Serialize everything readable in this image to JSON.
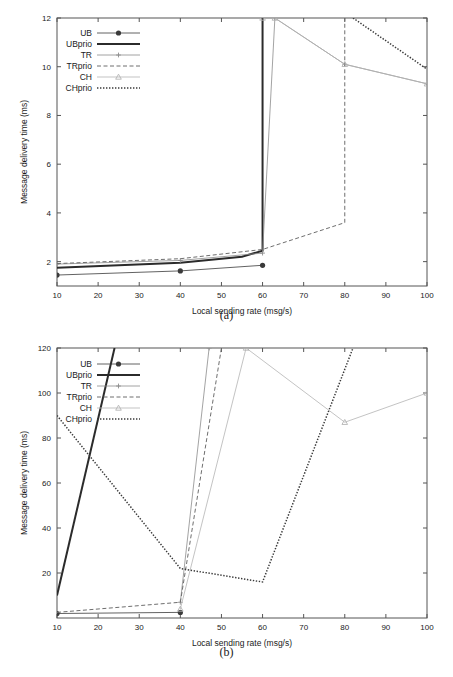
{
  "figure": {
    "caption_a": "(a)",
    "caption_b": "(b)"
  },
  "chart_data": [
    {
      "type": "line",
      "panel": "(a)",
      "title": "",
      "xlabel": "Local sending rate (msg/s)",
      "ylabel": "Message delivery time (ms)",
      "xlim": [
        10,
        100
      ],
      "ylim": [
        1,
        12
      ],
      "xticks": [
        10,
        20,
        30,
        40,
        50,
        60,
        70,
        80,
        90,
        100
      ],
      "yticks": [
        2,
        4,
        6,
        8,
        10,
        12
      ],
      "grid": false,
      "legend_position": "top-left",
      "series": [
        {
          "name": "UB",
          "style": "solid-thin-marker",
          "marker": "dot",
          "color": "#3a3a3a",
          "x": [
            10,
            40,
            60
          ],
          "y": [
            1.45,
            1.62,
            1.85
          ]
        },
        {
          "name": "UBprio",
          "style": "solid-thick",
          "marker": "none",
          "color": "#2b2b2b",
          "x": [
            10,
            40,
            55,
            60,
            60
          ],
          "y": [
            1.75,
            1.95,
            2.2,
            2.45,
            12.0
          ]
        },
        {
          "name": "TR",
          "style": "solid-thin-marker",
          "marker": "cross",
          "color": "#8c8c8c",
          "x": [
            10,
            40,
            60,
            63,
            80,
            100
          ],
          "y": [
            1.9,
            2.05,
            2.35,
            12.0,
            10.1,
            9.3
          ]
        },
        {
          "name": "TRprio",
          "style": "dashed",
          "marker": "none",
          "color": "#6e6e6e",
          "x": [
            10,
            40,
            60,
            80,
            80
          ],
          "y": [
            1.92,
            2.12,
            2.5,
            3.6,
            12.0
          ]
        },
        {
          "name": "CH",
          "style": "solid-light-marker",
          "marker": "triangle",
          "color": "#b4b4b4",
          "x": [
            60,
            63,
            80,
            100
          ],
          "y": [
            12.0,
            12.0,
            10.1,
            9.3
          ]
        },
        {
          "name": "CHprio",
          "style": "dotted",
          "marker": "none",
          "color": "#3a3a3a",
          "x": [
            82,
            100
          ],
          "y": [
            12.0,
            9.9
          ]
        }
      ]
    },
    {
      "type": "line",
      "panel": "(b)",
      "title": "",
      "xlabel": "Local sending rate (msg/s)",
      "ylabel": "Message delivery time (ms)",
      "xlim": [
        10,
        100
      ],
      "ylim": [
        0,
        120
      ],
      "xticks": [
        10,
        20,
        30,
        40,
        50,
        60,
        70,
        80,
        90,
        100
      ],
      "yticks": [
        20,
        40,
        60,
        80,
        100,
        120
      ],
      "grid": false,
      "legend_position": "top-left",
      "series": [
        {
          "name": "UB",
          "style": "solid-thin-marker",
          "marker": "dot",
          "color": "#3a3a3a",
          "x": [
            10,
            40
          ],
          "y": [
            2.0,
            2.5
          ]
        },
        {
          "name": "UBprio",
          "style": "solid-thick",
          "marker": "none",
          "color": "#2b2b2b",
          "x": [
            10,
            24
          ],
          "y": [
            10.0,
            120.0
          ]
        },
        {
          "name": "TR",
          "style": "solid-thin-marker",
          "marker": "cross",
          "color": "#8c8c8c",
          "x": [
            40,
            47
          ],
          "y": [
            7.0,
            120.0
          ]
        },
        {
          "name": "TRprio",
          "style": "dashed",
          "marker": "none",
          "color": "#6e6e6e",
          "x": [
            10,
            40,
            50
          ],
          "y": [
            2.5,
            7.0,
            120.0
          ]
        },
        {
          "name": "CH",
          "style": "solid-light-marker",
          "marker": "triangle",
          "color": "#b4b4b4",
          "x": [
            40,
            56,
            80,
            100
          ],
          "y": [
            4.0,
            120.0,
            87.0,
            100.0
          ]
        },
        {
          "name": "CHprio",
          "style": "dotted",
          "marker": "none",
          "color": "#3a3a3a",
          "x": [
            10,
            40,
            60,
            82
          ],
          "y": [
            90.0,
            22.0,
            16.0,
            120.0
          ]
        }
      ]
    }
  ]
}
